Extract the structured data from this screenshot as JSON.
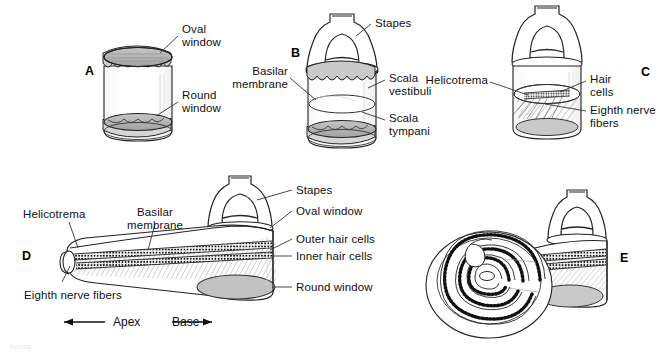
{
  "figure": {
    "background_color": "#ffffff",
    "ink_color": "#111111",
    "membrane_fill": "#b0b0b0",
    "shade_fill": "#d8d8d8"
  },
  "panels": [
    {
      "id": "A",
      "letter": "A",
      "labels": [
        {
          "name": "oval-window",
          "text": "Oval\nwindow"
        },
        {
          "name": "round-window",
          "text": "Round\nwindow"
        }
      ]
    },
    {
      "id": "B",
      "letter": "B",
      "labels": [
        {
          "name": "stapes",
          "text": "Stapes"
        },
        {
          "name": "basilar-membrane",
          "text": "Basilar\nmembrane"
        },
        {
          "name": "scala-vestibuli",
          "text": "Scala\nvestibuli"
        },
        {
          "name": "scala-tympani",
          "text": "Scala\ntympani"
        }
      ]
    },
    {
      "id": "C",
      "letter": "C",
      "labels": [
        {
          "name": "helicotrema",
          "text": "Helicotrema"
        },
        {
          "name": "hair-cells",
          "text": "Hair\ncells"
        },
        {
          "name": "eighth-nerve-fibers",
          "text": "Eighth nerve\nfibers"
        }
      ]
    },
    {
      "id": "D",
      "letter": "D",
      "labels": [
        {
          "name": "helicotrema",
          "text": "Helicotrema"
        },
        {
          "name": "basilar-membrane",
          "text": "Basilar\nmembrane"
        },
        {
          "name": "stapes",
          "text": "Stapes"
        },
        {
          "name": "oval-window",
          "text": "Oval window"
        },
        {
          "name": "outer-hair-cells",
          "text": "Outer hair cells"
        },
        {
          "name": "inner-hair-cells",
          "text": "Inner hair cells"
        },
        {
          "name": "round-window",
          "text": "Round window"
        },
        {
          "name": "eighth-nerve-fibers",
          "text": "Eighth nerve fibers"
        }
      ],
      "axis": {
        "apex_label": "Apex",
        "base_label": "Base",
        "apex_arrow": "left",
        "base_arrow": "right"
      }
    },
    {
      "id": "E",
      "letter": "E",
      "labels": []
    }
  ],
  "labels_flat": {
    "a_oval_window_line1": "Oval",
    "a_oval_window_line2": "window",
    "a_round_window_line1": "Round",
    "a_round_window_line2": "window",
    "b_stapes": "Stapes",
    "b_basilar_line1": "Basilar",
    "b_basilar_line2": "membrane",
    "b_scala_vestibuli_line1": "Scala",
    "b_scala_vestibuli_line2": "vestibuli",
    "b_scala_tympani_line1": "Scala",
    "b_scala_tympani_line2": "tympani",
    "c_helicotrema": "Helicotrema",
    "c_hair_cells_line1": "Hair",
    "c_hair_cells_line2": "cells",
    "c_eighth_nerve_line1": "Eighth nerve",
    "c_eighth_nerve_line2": "fibers",
    "d_helicotrema": "Helicotrema",
    "d_basilar_line1": "Basilar",
    "d_basilar_line2": "membrane",
    "d_stapes": "Stapes",
    "d_oval_window": "Oval window",
    "d_outer_hair_cells": "Outer hair cells",
    "d_inner_hair_cells": "Inner hair cells",
    "d_round_window": "Round window",
    "d_eighth_nerve_fibers": "Eighth nerve fibers",
    "d_apex": "Apex",
    "d_base": "Base"
  },
  "panel_letters": {
    "a": "A",
    "b": "B",
    "c": "C",
    "d": "D",
    "e": "E"
  },
  "caption": {
    "text": "FIGURE"
  }
}
